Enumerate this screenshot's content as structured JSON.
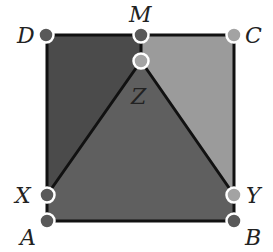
{
  "diagram": {
    "type": "geometry-square-partition",
    "colors": {
      "background": "#ffffff",
      "region_left": "#4b4b4b",
      "region_right": "#9b9b9b",
      "region_center": "#5f5f5f",
      "edge": "#111111",
      "point_dark": "#595959",
      "point_light": "#a3a3a3",
      "point_outline": "#ffffff"
    },
    "points": [
      {
        "id": "D",
        "label": "D",
        "x": 46,
        "y": 35,
        "shade": "dark"
      },
      {
        "id": "M",
        "label": "M",
        "x": 141,
        "y": 35,
        "shade": "dark"
      },
      {
        "id": "C",
        "label": "C",
        "x": 234,
        "y": 35,
        "shade": "light"
      },
      {
        "id": "Z",
        "label": "Z",
        "x": 141,
        "y": 61,
        "shade": "light"
      },
      {
        "id": "X",
        "label": "X",
        "x": 47,
        "y": 195,
        "shade": "dark"
      },
      {
        "id": "Y",
        "label": "Y",
        "x": 234,
        "y": 195,
        "shade": "light"
      },
      {
        "id": "A",
        "label": "A",
        "x": 47,
        "y": 221,
        "shade": "dark"
      },
      {
        "id": "B",
        "label": "B",
        "x": 234,
        "y": 221,
        "shade": "dark"
      }
    ],
    "segments": [
      [
        "D",
        "C"
      ],
      [
        "D",
        "A"
      ],
      [
        "C",
        "B"
      ],
      [
        "A",
        "B"
      ],
      [
        "M",
        "Z"
      ],
      [
        "Z",
        "X"
      ],
      [
        "Z",
        "Y"
      ]
    ],
    "regions": [
      {
        "name": "left-region",
        "vertices": [
          "D",
          "M",
          "Z",
          "X"
        ],
        "color_key": "region_left"
      },
      {
        "name": "right-region",
        "vertices": [
          "M",
          "C",
          "Y",
          "Z"
        ],
        "color_key": "region_right"
      },
      {
        "name": "center-region",
        "vertices": [
          "Z",
          "Y",
          "B",
          "A",
          "X"
        ],
        "color_key": "region_center"
      }
    ]
  },
  "labels": {
    "D": "D",
    "M": "M",
    "C": "C",
    "Z": "Z",
    "X": "X",
    "Y": "Y",
    "A": "A",
    "B": "B"
  }
}
